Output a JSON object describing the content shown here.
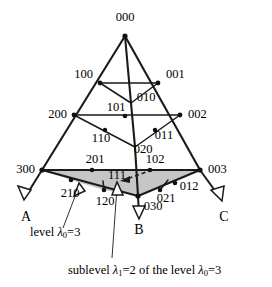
{
  "figure": {
    "type": "simplex-lattice-diagram",
    "apex_label": "000",
    "axes": [
      {
        "id": "axis-a",
        "label": "A",
        "x": 26,
        "y": 218
      },
      {
        "id": "axis-b",
        "label": "B",
        "x": 139,
        "y": 231
      },
      {
        "id": "axis-c",
        "label": "C",
        "x": 224,
        "y": 218
      }
    ],
    "nodes": [
      {
        "id": "n-000",
        "label": "000",
        "x": 125,
        "y": 36,
        "lx": 125,
        "ly": 18,
        "anchor": "middle",
        "dot": true
      },
      {
        "id": "n-100",
        "label": "100",
        "x": 100,
        "y": 83,
        "lx": 93,
        "ly": 75,
        "anchor": "end",
        "dot": true
      },
      {
        "id": "n-001",
        "label": "001",
        "x": 158,
        "y": 83,
        "lx": 166,
        "ly": 75,
        "anchor": "start",
        "dot": true
      },
      {
        "id": "n-010",
        "label": "010",
        "x": 131,
        "y": 103,
        "lx": 146,
        "ly": 98,
        "anchor": "middle",
        "dot": false
      },
      {
        "id": "n-101",
        "label": "101",
        "x": 125,
        "y": 116,
        "lx": 116,
        "ly": 108,
        "anchor": "middle",
        "dot": true
      },
      {
        "id": "n-200",
        "label": "200",
        "x": 74,
        "y": 115,
        "lx": 67,
        "ly": 115,
        "anchor": "end",
        "dot": true
      },
      {
        "id": "n-002",
        "label": "002",
        "x": 180,
        "y": 115,
        "lx": 188,
        "ly": 115,
        "anchor": "start",
        "dot": true
      },
      {
        "id": "n-110",
        "label": "110",
        "x": 105,
        "y": 130,
        "lx": 101,
        "ly": 139,
        "anchor": "middle",
        "dot": true
      },
      {
        "id": "n-011",
        "label": "011",
        "x": 155,
        "y": 130,
        "lx": 162,
        "ly": 135,
        "anchor": "middle",
        "dot": true
      },
      {
        "id": "n-020",
        "label": "020",
        "x": 137,
        "y": 143,
        "lx": 143,
        "ly": 150,
        "anchor": "middle",
        "dot": false
      },
      {
        "id": "n-300",
        "label": "300",
        "x": 42,
        "y": 170,
        "lx": 35,
        "ly": 170,
        "anchor": "end",
        "dot": true
      },
      {
        "id": "n-003",
        "label": "003",
        "x": 200,
        "y": 170,
        "lx": 208,
        "ly": 170,
        "anchor": "start",
        "dot": true
      },
      {
        "id": "n-201",
        "label": "201",
        "x": 92,
        "y": 170,
        "lx": 95,
        "ly": 160,
        "anchor": "middle",
        "dot": true
      },
      {
        "id": "n-102",
        "label": "102",
        "x": 150,
        "y": 170,
        "lx": 153,
        "ly": 160,
        "anchor": "middle",
        "dot": true
      },
      {
        "id": "n-111",
        "label": "111",
        "x": 121,
        "y": 177,
        "lx": 117,
        "ly": 174,
        "anchor": "middle",
        "dot": false
      },
      {
        "id": "n-210",
        "label": "210",
        "x": 71,
        "y": 180,
        "lx": 70,
        "ly": 192,
        "anchor": "middle",
        "dot": true
      },
      {
        "id": "n-012",
        "label": "012",
        "x": 175,
        "y": 183,
        "lx": 187,
        "ly": 187,
        "anchor": "middle",
        "dot": true
      },
      {
        "id": "n-120",
        "label": "120",
        "x": 104,
        "y": 190,
        "lx": 104,
        "ly": 200,
        "anchor": "middle",
        "dot": true
      },
      {
        "id": "n-021",
        "label": "021",
        "x": 160,
        "y": 190,
        "lx": 163,
        "ly": 198,
        "anchor": "middle",
        "dot": true
      },
      {
        "id": "n-030",
        "label": "030",
        "x": 138,
        "y": 196,
        "lx": 150,
        "ly": 205,
        "anchor": "middle",
        "dot": true
      }
    ],
    "annotations": [
      {
        "id": "ann-level",
        "text_parts": [
          "level ",
          "λ",
          "0",
          "=3"
        ],
        "text": "level λ0=3",
        "x": 30,
        "y": 232
      },
      {
        "id": "ann-sublevel",
        "text_parts": [
          "sublevel ",
          "λ",
          "1",
          "=2 of the level ",
          "λ",
          "0",
          "=3"
        ],
        "text": "sublevel λ1=2 of the level λ0=3",
        "x": 68,
        "y": 270
      }
    ],
    "shaded_region": {
      "id": "sublevel-patch",
      "fill": "#c6c6c6",
      "caption_ref": "ann-sublevel"
    },
    "colors": {
      "stroke": "#1a1a1a",
      "shade": "#c6c6c6",
      "background": "#ffffff",
      "node": "#111111"
    }
  }
}
